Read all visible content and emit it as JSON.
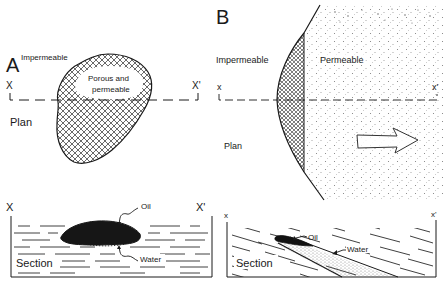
{
  "panel_a": {
    "label": "A",
    "plan": {
      "impermeable_label": "Impermeable",
      "porous_label_line1": "Porous and",
      "porous_label_line2": "permeable",
      "x_label": "X",
      "x_prime_label": "X'",
      "view_label": "Plan"
    },
    "section": {
      "x_label": "X",
      "x_prime_label": "X'",
      "oil_label": "Oil",
      "water_label": "Water",
      "view_label": "Section"
    }
  },
  "panel_b": {
    "label": "B",
    "plan": {
      "impermeable_label": "Impermeable",
      "permeable_label": "Permeable",
      "x_label": "x",
      "x_prime_label": "x'",
      "view_label": "Plan"
    },
    "section": {
      "x_label": "x",
      "x_prime_label": "x'",
      "oil_label": "Oil",
      "water_label": "Water",
      "view_label": "Section"
    }
  },
  "colors": {
    "ink": "#1a1a1a",
    "background": "#ffffff",
    "stipple": "#8a8a8a"
  }
}
